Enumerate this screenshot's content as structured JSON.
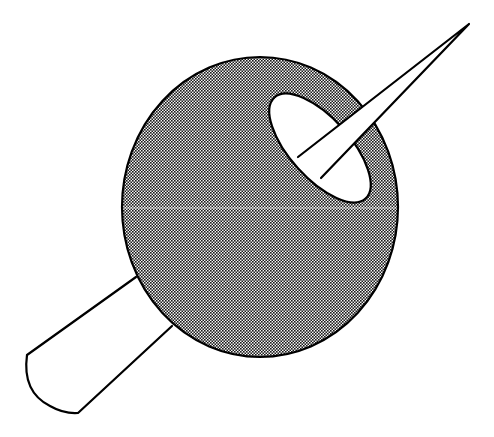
{
  "figure": {
    "description": "Line illustration of a halftone-shaded sphere pierced diagonally by a tapered rod; the rod's rounded handle exits lower-left and its needle point exits upper-right through an elliptical opening",
    "colors": {
      "background": "#ffffff",
      "outline": "#000000",
      "halftone_dark": "#1a1a1a",
      "halftone_light": "#f4f4f4",
      "hole_fill": "#ffffff",
      "rod_fill": "#ffffff"
    },
    "sphere": {
      "cx": 260,
      "cy": 207,
      "rx": 138,
      "ry": 150,
      "fill": "checkerboard-halftone"
    },
    "hole": {
      "cx": 320,
      "cy": 148,
      "rx": 68,
      "ry": 30,
      "rotate": 48
    },
    "rod_tip": {
      "x": 469,
      "y": 24
    },
    "handle_end": {
      "corner": [
        27,
        355
      ],
      "bottom": [
        78,
        413
      ]
    },
    "labels": []
  }
}
